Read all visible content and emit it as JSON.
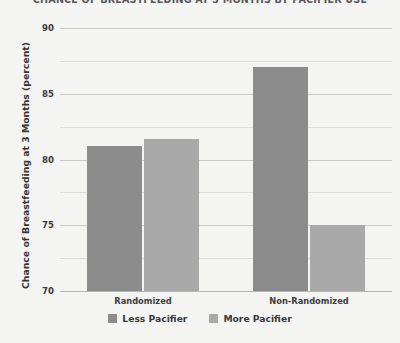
{
  "chart_data": {
    "type": "bar",
    "title": "CHANCE OF BREASTFEEDING AT 3 MONTHS BY PACIFIER USE",
    "xlabel": "",
    "ylabel": "Chance of Breastfeeding at 3 Months (percent)",
    "categories": [
      "Randomized",
      "Non-Randomized"
    ],
    "series": [
      {
        "name": "Less Pacifier",
        "color": "#8c8c8c",
        "values": [
          81.0,
          87.0
        ]
      },
      {
        "name": "More Pacifier",
        "color": "#a9a9a9",
        "values": [
          81.6,
          75.0
        ]
      }
    ],
    "ylim": [
      70,
      90
    ],
    "yticks": [
      70,
      75,
      80,
      85,
      90
    ],
    "ytick_labels": [
      "70",
      "75",
      "80",
      "85",
      "90"
    ],
    "minor_yticks": [
      72.5,
      77.5,
      82.5,
      87.5
    ],
    "grid": true,
    "legend_position": "bottom",
    "background_color": "#f4f4f2",
    "gridline_color": "#c9c9c9"
  }
}
